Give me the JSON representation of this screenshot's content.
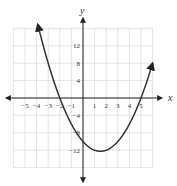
{
  "chart_data": {
    "type": "line",
    "title": "",
    "xlabel": "x",
    "ylabel": "y",
    "xlim": [
      -6,
      6
    ],
    "ylim": [
      -16,
      16
    ],
    "grid": true,
    "x_ticks": [
      "−5",
      "−4",
      "−3",
      "−2",
      "−1",
      "1",
      "2",
      "3",
      "4",
      "5"
    ],
    "x_tick_values": [
      -5,
      -4,
      -3,
      -2,
      -1,
      1,
      2,
      3,
      4,
      5
    ],
    "y_ticks": [
      "12",
      "8",
      "4",
      "−4",
      "−8",
      "−12"
    ],
    "y_tick_values": [
      12,
      8,
      4,
      -4,
      -8,
      -12
    ],
    "series": [
      {
        "name": "parabola",
        "equation": "y = x^2 - 3x - 10",
        "x_intercepts": [
          -2,
          5
        ],
        "y_intercept": -10,
        "vertex": [
          1.5,
          -12.25
        ],
        "x": [
          -4,
          -3,
          -2,
          -1,
          0,
          1,
          1.5,
          2,
          3,
          4,
          5,
          6
        ],
        "values": [
          18,
          8,
          0,
          -6,
          -10,
          -12,
          -12.25,
          -12,
          -10,
          -6,
          0,
          8
        ],
        "color": "#333333"
      }
    ]
  }
}
